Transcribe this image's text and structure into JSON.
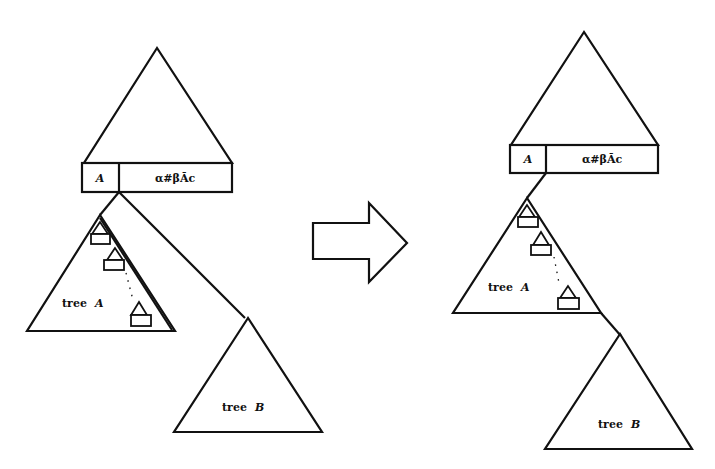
{
  "diagram": {
    "type": "tree-transformation",
    "arrow": {
      "direction": "right"
    },
    "before": {
      "top_node": {
        "cells": [
          "A",
          "α#βĀc"
        ]
      },
      "subtree_a": {
        "label_prefix": "tree",
        "label_var": "A"
      },
      "subtree_b": {
        "label_prefix": "tree",
        "label_var": "B"
      }
    },
    "after": {
      "top_node": {
        "cells": [
          "A",
          "α#βĀc"
        ]
      },
      "subtree_a": {
        "label_prefix": "tree",
        "label_var": "A"
      },
      "subtree_b": {
        "label_prefix": "tree",
        "label_var": "B"
      }
    }
  }
}
